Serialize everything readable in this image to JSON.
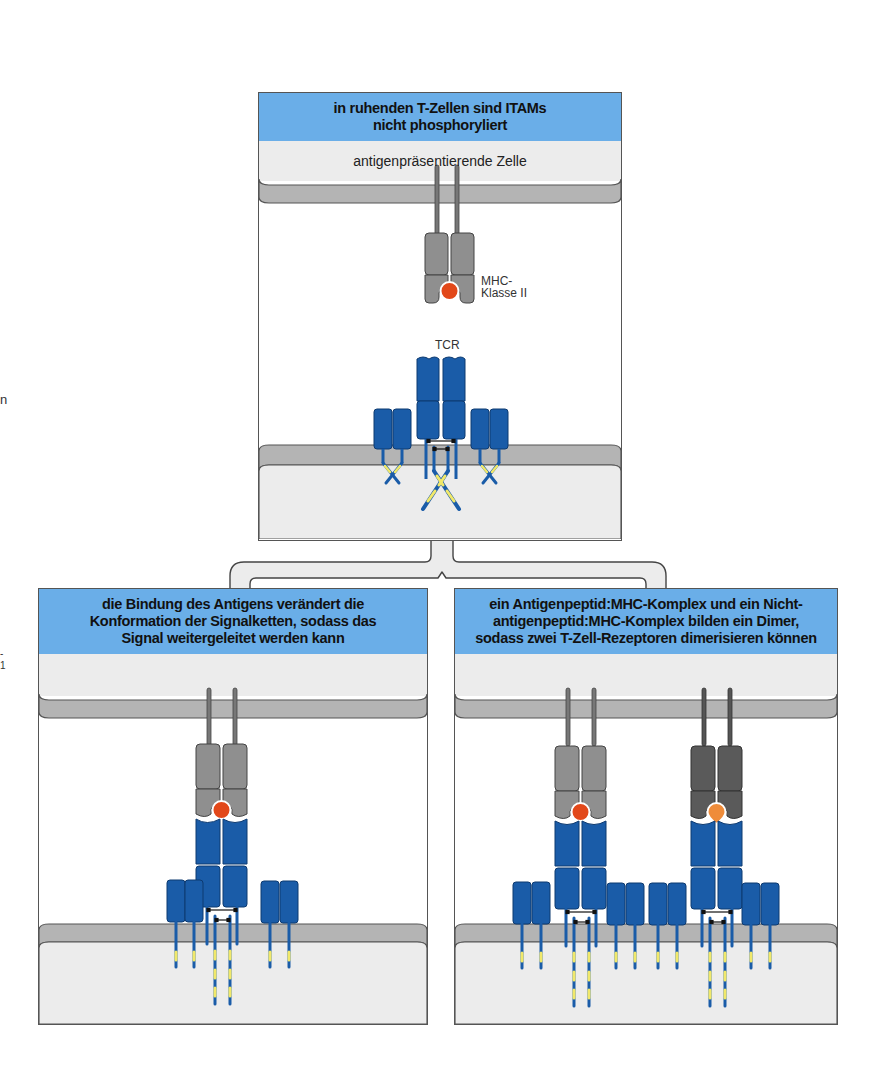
{
  "figure": {
    "colors": {
      "header_blue": "#6aaee8",
      "membrane_gray": "#b4b4b4",
      "cytoplasm_gray": "#ececec",
      "mhc_gray": "#8f8f8f",
      "mhc_dark_gray": "#5a5a5a",
      "tcr_blue": "#1a5ca8",
      "itam_yellow": "#f1e86a",
      "peptide_red": "#e2481a",
      "peptide_orange": "#ef8c3a"
    },
    "side_marks": [
      "n",
      "-",
      "1"
    ]
  },
  "panels": {
    "top": {
      "header": "in ruhenden T-Zellen sind ITAMs\nnicht phosphoryliert",
      "cell_label": "antigenpräsentierende Zelle",
      "mhc_label": "MHC-\nKlasse II",
      "tcr_label": "TCR"
    },
    "bottom_left": {
      "header": "die Bindung des Antigens verändert die\nKonformation der Signalketten, sodass das\nSignal weitergeleitet werden kann"
    },
    "bottom_right": {
      "header": "ein Antigenpeptid:MHC-Komplex und ein Nicht-\nantigenpeptid:MHC-Komplex bilden ein Dimer,\nsodass zwei T-Zell-Rezeptoren dimerisieren können"
    }
  }
}
